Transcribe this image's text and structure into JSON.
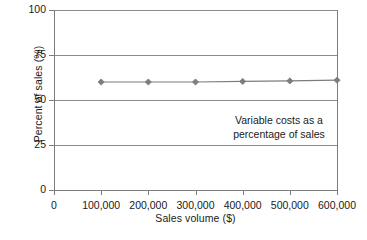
{
  "chart_data": {
    "type": "line",
    "title": "",
    "xlabel": "Sales volume ($)",
    "ylabel": "Percent of sales (%)",
    "xlim": [
      0,
      600000
    ],
    "ylim": [
      0,
      100
    ],
    "grid": "horizontal",
    "legend": "none",
    "x_ticks": [
      0,
      100000,
      200000,
      300000,
      400000,
      500000,
      600000
    ],
    "x_tick_labels": [
      "0",
      "100,000",
      "200,000",
      "300,000",
      "400,000",
      "500,000",
      "600,000"
    ],
    "y_ticks": [
      0,
      25,
      50,
      75,
      100
    ],
    "y_tick_labels": [
      "0",
      "25",
      "50",
      "75",
      "100"
    ],
    "series": [
      {
        "name": "Variable costs as a percentage of sales",
        "color": "#7d7d7d",
        "marker": "diamond",
        "x": [
          100000,
          200000,
          300000,
          400000,
          500000,
          600000
        ],
        "values": [
          60,
          60,
          60,
          60.3,
          60.6,
          61
        ]
      }
    ],
    "annotations": [
      {
        "line1": "Variable costs as a",
        "line2": "percentage of sales",
        "x": 390000,
        "y": 38
      }
    ]
  },
  "colors": {
    "series": "#7d7d7d",
    "grid": "#8c8c8c",
    "axis": "#7d7d7d",
    "text": "#1a1a1a",
    "background": "#ffffff"
  }
}
